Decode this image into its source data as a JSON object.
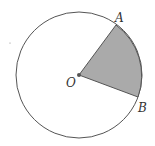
{
  "diagram": {
    "type": "circle-sector",
    "circle": {
      "cx": 79,
      "cy": 75,
      "r": 63,
      "stroke": "#555555"
    },
    "sector": {
      "fill": "#aaaaaa",
      "stroke": "#555555"
    },
    "points": {
      "O": {
        "label": "O",
        "x": 79,
        "y": 75
      },
      "A": {
        "label": "A",
        "x": 116,
        "y": 25
      },
      "B": {
        "label": "B",
        "x": 138,
        "y": 97
      }
    },
    "stray_mark": {
      "x": 10,
      "y": 43
    }
  }
}
